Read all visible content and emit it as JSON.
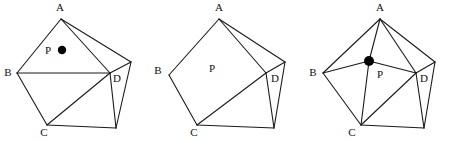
{
  "canvas": {
    "width": 453,
    "height": 142,
    "background": "#ffffff",
    "stroke_color": "#1a1a1a",
    "dot_color": "#000000"
  },
  "figures": [
    {
      "id": "figure-1",
      "offset_x": 0,
      "labels": {
        "A": "A",
        "B": "B",
        "C": "C",
        "D": "D",
        "P": "P"
      },
      "label_positions": {
        "A": [
          60,
          11
        ],
        "B": [
          8,
          76
        ],
        "C": [
          44,
          136
        ],
        "D": [
          117,
          82
        ],
        "P": [
          48,
          54
        ]
      },
      "vertices": {
        "A": [
          61,
          19
        ],
        "B": [
          17,
          73
        ],
        "C": [
          47,
          125
        ],
        "E2": [
          116,
          128
        ],
        "E1": [
          131,
          62
        ],
        "D": [
          110,
          73
        ]
      },
      "edges": [
        [
          "A",
          "B"
        ],
        [
          "B",
          "C"
        ],
        [
          "C",
          "E2"
        ],
        [
          "E2",
          "E1"
        ],
        [
          "E1",
          "A"
        ]
      ],
      "chords": [
        [
          "A",
          "D"
        ],
        [
          "B",
          "D"
        ],
        [
          "C",
          "D"
        ],
        [
          "D",
          "E1"
        ],
        [
          "D",
          "E2"
        ]
      ],
      "point": {
        "label": "P",
        "center": [
          62,
          50
        ],
        "radius": 4.2,
        "visible": true,
        "connected_to": []
      }
    },
    {
      "id": "figure-2",
      "offset_x": 150,
      "labels": {
        "A": "A",
        "B": "B",
        "C": "C",
        "D": "D",
        "P": "P"
      },
      "label_positions": {
        "A": [
          69,
          11
        ],
        "B": [
          8,
          74
        ],
        "C": [
          44,
          136
        ],
        "D": [
          125,
          82
        ],
        "P": [
          62,
          72
        ]
      },
      "vertices": {
        "A": [
          69,
          19
        ],
        "B": [
          19,
          75
        ],
        "C": [
          47,
          125
        ],
        "E2": [
          124,
          128
        ],
        "E1": [
          135,
          62
        ],
        "D": [
          116,
          73
        ]
      },
      "edges": [
        [
          "A",
          "B"
        ],
        [
          "B",
          "C"
        ],
        [
          "C",
          "E2"
        ],
        [
          "E2",
          "E1"
        ],
        [
          "E1",
          "A"
        ]
      ],
      "chords": [
        [
          "A",
          "D"
        ],
        [
          "C",
          "D"
        ],
        [
          "D",
          "E1"
        ],
        [
          "D",
          "E2"
        ]
      ],
      "point": {
        "label": "P",
        "center": null,
        "radius": 0,
        "visible": false,
        "connected_to": []
      }
    },
    {
      "id": "figure-3",
      "offset_x": 300,
      "labels": {
        "A": "A",
        "B": "B",
        "C": "C",
        "D": "D",
        "P": "P"
      },
      "label_positions": {
        "A": [
          80,
          11
        ],
        "B": [
          13,
          76
        ],
        "C": [
          52,
          136
        ],
        "D": [
          124,
          82
        ],
        "P": [
          80,
          78
        ]
      },
      "vertices": {
        "A": [
          80,
          19
        ],
        "B": [
          23,
          73
        ],
        "C": [
          61,
          125
        ],
        "E2": [
          124,
          128
        ],
        "E1": [
          135,
          62
        ],
        "D": [
          116,
          73
        ]
      },
      "edges": [
        [
          "A",
          "B"
        ],
        [
          "B",
          "C"
        ],
        [
          "C",
          "E2"
        ],
        [
          "E2",
          "E1"
        ],
        [
          "E1",
          "A"
        ]
      ],
      "chords": [
        [
          "A",
          "D"
        ],
        [
          "C",
          "D"
        ],
        [
          "D",
          "E1"
        ],
        [
          "D",
          "E2"
        ]
      ],
      "point": {
        "label": "P",
        "center": [
          69,
          61
        ],
        "radius": 5,
        "visible": true,
        "connected_to": [
          "A",
          "B",
          "C",
          "D"
        ]
      }
    }
  ]
}
